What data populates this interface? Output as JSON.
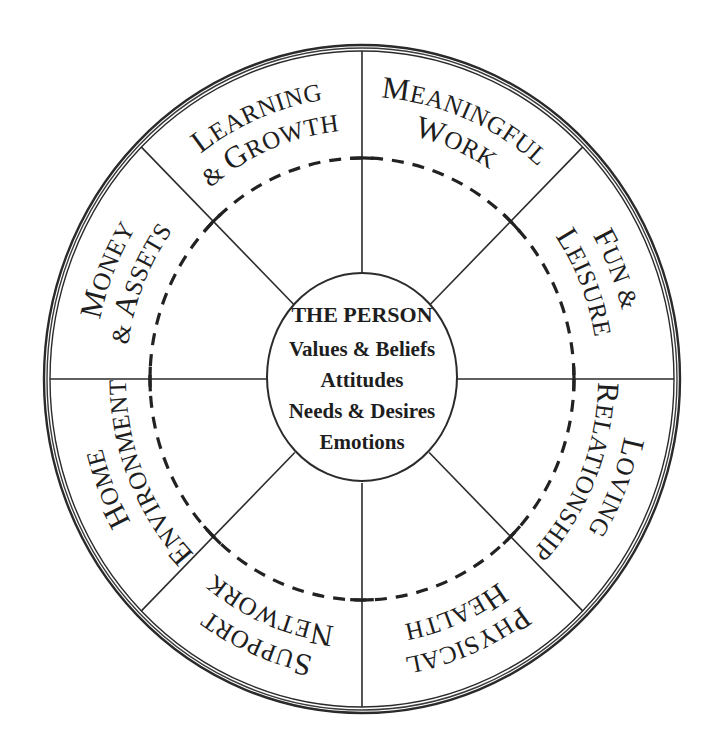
{
  "diagram": {
    "type": "wheel",
    "center": {
      "title": "THE PERSON",
      "lines": [
        "Values & Beliefs",
        "Attitudes",
        "Needs & Desires",
        "Emotions"
      ]
    },
    "sectors": [
      {
        "id": "meaningful-work",
        "line1": "Meaningful",
        "line2": "Work"
      },
      {
        "id": "fun-leisure",
        "line1": "Fun &",
        "line2": "Leisure"
      },
      {
        "id": "loving-relationship",
        "line1": "Loving",
        "line2": "Relationship"
      },
      {
        "id": "physical-health",
        "line1": "Physical",
        "line2": "Health"
      },
      {
        "id": "support-network",
        "line1": "Support",
        "line2": "Network"
      },
      {
        "id": "home-environment",
        "line1": "Home",
        "line2": "Environment"
      },
      {
        "id": "money-assets",
        "line1": "Money",
        "line2": "& Assets"
      },
      {
        "id": "learning-growth",
        "line1": "Learning",
        "line2": "& Growth"
      }
    ],
    "colors": {
      "ink": "#1e1e1e",
      "background": "#ffffff"
    }
  }
}
